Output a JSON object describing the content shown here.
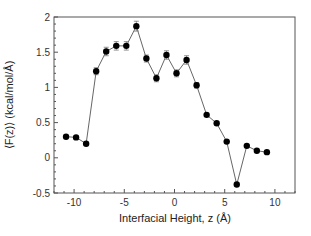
{
  "chart_data": {
    "type": "line",
    "title": "",
    "xlabel": "Interfacial Height, z (Å)",
    "ylabel": "⟨F(z)⟩ (kcal/mol/Å)",
    "xlim": [
      -12,
      12
    ],
    "ylim": [
      -0.5,
      2
    ],
    "xticks": [
      -10,
      -5,
      0,
      5,
      10
    ],
    "yticks": [
      -0.5,
      0,
      0.5,
      1,
      1.5,
      2
    ],
    "xtick_labels": [
      "-10",
      "-5",
      "0",
      "5",
      "10"
    ],
    "ytick_labels": [
      "-0.5",
      "0",
      "0.5",
      "1",
      "1.5",
      "2"
    ],
    "grid": false,
    "legend": null,
    "series": [
      {
        "name": "⟨F(z)⟩",
        "marker": "filled-circle",
        "color": "#000000",
        "line_color": "#555555",
        "x": [
          -10.8,
          -9.8,
          -8.8,
          -7.8,
          -6.8,
          -5.8,
          -4.8,
          -3.8,
          -2.8,
          -1.8,
          -0.8,
          0.2,
          1.2,
          2.2,
          3.2,
          4.2,
          5.2,
          6.2,
          7.2,
          8.2,
          9.2
        ],
        "values": [
          0.3,
          0.29,
          0.2,
          1.23,
          1.51,
          1.59,
          1.59,
          1.87,
          1.41,
          1.13,
          1.46,
          1.2,
          1.39,
          1.03,
          0.61,
          0.49,
          0.23,
          -0.38,
          0.17,
          0.1,
          0.08
        ],
        "error": [
          0,
          0,
          0,
          0.05,
          0.06,
          0.06,
          0.06,
          0.07,
          0.05,
          0.05,
          0.06,
          0.05,
          0.06,
          0.04,
          0,
          0,
          0,
          0,
          0,
          0,
          0
        ]
      }
    ]
  }
}
